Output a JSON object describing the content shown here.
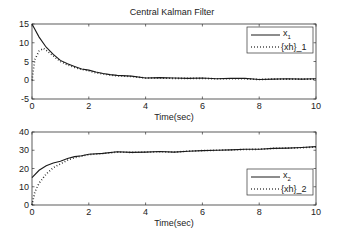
{
  "chart_data": [
    {
      "type": "line",
      "title": "Central Kalman Filter",
      "xlabel": "Time(sec)",
      "ylabel": "",
      "xlim": [
        0,
        10
      ],
      "ylim": [
        -5,
        15
      ],
      "xticks": [
        0,
        2,
        4,
        6,
        8,
        10
      ],
      "yticks": [
        -5,
        0,
        5,
        10,
        15
      ],
      "grid": false,
      "legend_position": "upper right",
      "series": [
        {
          "name": "x_1",
          "style": "solid",
          "x": [
            0,
            0.25,
            0.5,
            0.75,
            1.0,
            1.25,
            1.5,
            1.75,
            2.0,
            2.25,
            2.5,
            2.75,
            3.0,
            3.5,
            4.0,
            4.5,
            5.0,
            5.5,
            6.0,
            6.5,
            7.0,
            7.5,
            8.0,
            8.5,
            9.0,
            9.5,
            10.0
          ],
          "y": [
            15,
            11.5,
            8.8,
            6.9,
            5.3,
            4.4,
            3.7,
            3.0,
            2.7,
            2.2,
            1.8,
            1.5,
            1.3,
            1.1,
            0.6,
            0.7,
            0.6,
            0.5,
            0.6,
            0.4,
            0.5,
            0.5,
            0.2,
            0.3,
            0.4,
            0.3,
            0.4
          ]
        },
        {
          "name": "{xh}_1",
          "style": "dotted",
          "x": [
            0,
            0.1,
            0.25,
            0.4,
            0.5,
            0.75,
            1.0,
            1.25,
            1.5,
            1.75,
            2.0,
            2.25,
            2.5,
            2.75,
            3.0,
            3.5,
            4.0,
            4.5,
            5.0,
            5.5,
            6.0,
            6.5,
            7.0,
            7.5,
            8.0,
            8.5,
            9.0,
            9.5,
            10.0
          ],
          "y": [
            0,
            5.5,
            7.8,
            8.5,
            8.0,
            6.5,
            5.0,
            4.1,
            3.4,
            2.9,
            2.5,
            2.0,
            1.7,
            1.4,
            1.2,
            1.0,
            0.6,
            0.6,
            0.5,
            0.5,
            0.5,
            0.4,
            0.4,
            0.4,
            0.2,
            0.3,
            0.3,
            0.3,
            0.3
          ]
        }
      ]
    },
    {
      "type": "line",
      "title": "",
      "xlabel": "Time(sec)",
      "ylabel": "",
      "xlim": [
        0,
        10
      ],
      "ylim": [
        0,
        40
      ],
      "xticks": [
        0,
        2,
        4,
        6,
        8,
        10
      ],
      "yticks": [
        0,
        10,
        20,
        30,
        40
      ],
      "grid": false,
      "legend_position": "lower right",
      "series": [
        {
          "name": "x_2",
          "style": "solid",
          "x": [
            0,
            0.25,
            0.5,
            0.75,
            1.0,
            1.25,
            1.5,
            1.75,
            2.0,
            2.5,
            3.0,
            3.5,
            4.0,
            4.5,
            5.0,
            5.5,
            6.0,
            6.5,
            7.0,
            7.5,
            8.0,
            8.5,
            9.0,
            9.5,
            10.0
          ],
          "y": [
            15,
            19,
            21.5,
            23,
            24,
            25.5,
            26.5,
            27,
            27.8,
            28.3,
            29.2,
            28.8,
            29.0,
            29.3,
            29.0,
            29.5,
            29.8,
            30.0,
            30.2,
            30.5,
            30.5,
            31.0,
            31.2,
            31.5,
            32.0
          ]
        },
        {
          "name": "{xh}_2",
          "style": "dotted",
          "x": [
            0,
            0.1,
            0.25,
            0.5,
            0.75,
            1.0,
            1.25,
            1.5,
            1.75,
            2.0,
            2.5,
            3.0,
            3.5,
            4.0,
            4.5,
            5.0,
            5.5,
            6.0,
            6.5,
            7.0,
            7.5,
            8.0,
            8.5,
            9.0,
            9.5,
            10.0
          ],
          "y": [
            0,
            7,
            12,
            17,
            20.5,
            22.5,
            24.5,
            26,
            26.8,
            27.6,
            28.2,
            29.0,
            28.8,
            29.0,
            29.2,
            29.0,
            29.5,
            29.8,
            30.0,
            30.2,
            30.4,
            30.5,
            31.0,
            31.2,
            31.4,
            31.8
          ]
        }
      ]
    }
  ],
  "figure": {
    "title": "Central Kalman Filter",
    "top_legend": [
      {
        "label_main": "x",
        "label_sub": "1"
      },
      {
        "label_main": "{xh}_1",
        "label_sub": ""
      }
    ],
    "bottom_legend": [
      {
        "label_main": "x",
        "label_sub": "2"
      },
      {
        "label_main": "{xh}_2",
        "label_sub": ""
      }
    ],
    "line_color": "#1a1a1a",
    "axis_color": "#333333"
  }
}
